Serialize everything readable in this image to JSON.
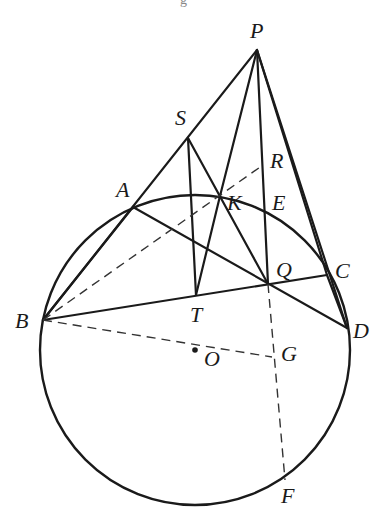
{
  "figure": {
    "caption_fragment": "g",
    "circle": {
      "center": "O",
      "cx": 195,
      "cy": 350,
      "r": 155
    },
    "points": {
      "P": {
        "x": 257,
        "y": 50,
        "label": "P",
        "lx": 250,
        "ly": 38
      },
      "S": {
        "x": 188,
        "y": 138,
        "label": "S",
        "lx": 175,
        "ly": 125
      },
      "A": {
        "x": 133,
        "y": 207,
        "label": "A",
        "lx": 116,
        "ly": 197
      },
      "B": {
        "x": 43,
        "y": 320,
        "label": "B",
        "lx": 15,
        "ly": 328
      },
      "K": {
        "x": 220,
        "y": 196,
        "label": "K",
        "lx": 227,
        "ly": 210
      },
      "R": {
        "x": 263,
        "y": 165,
        "label": "R",
        "lx": 270,
        "ly": 168
      },
      "E": {
        "x": 265,
        "y": 212,
        "label": "E",
        "lx": 272,
        "ly": 210
      },
      "Q": {
        "x": 268,
        "y": 284,
        "label": "Q",
        "lx": 276,
        "ly": 277
      },
      "C": {
        "x": 327,
        "y": 275,
        "label": "C",
        "lx": 335,
        "ly": 278
      },
      "D": {
        "x": 347,
        "y": 328,
        "label": "D",
        "lx": 353,
        "ly": 338
      },
      "T": {
        "x": 196,
        "y": 295,
        "label": "T",
        "lx": 190,
        "ly": 322
      },
      "O": {
        "x": 195,
        "y": 350,
        "label": "O",
        "lx": 204,
        "ly": 366
      },
      "G": {
        "x": 272,
        "y": 357,
        "label": "G",
        "lx": 281,
        "ly": 361
      },
      "F": {
        "x": 285,
        "y": 480,
        "label": "F",
        "lx": 281,
        "ly": 503
      }
    },
    "solid_segments": [
      [
        "P",
        "B"
      ],
      [
        "P",
        "K"
      ],
      [
        "P",
        "Q"
      ],
      [
        "P",
        "C"
      ],
      [
        "P",
        "D"
      ],
      [
        "S",
        "T"
      ],
      [
        "S",
        "Q"
      ],
      [
        "B",
        "C"
      ],
      [
        "A",
        "D"
      ],
      [
        "B",
        "A"
      ],
      [
        "T",
        "K"
      ],
      [
        "C",
        "D"
      ]
    ],
    "dashed_segments": [
      [
        "B",
        "R"
      ],
      [
        "B",
        "G"
      ],
      [
        "Q",
        "F"
      ]
    ],
    "center_dot": "O",
    "colors": {
      "ink": "#1a1a1a",
      "background": "#ffffff"
    }
  }
}
